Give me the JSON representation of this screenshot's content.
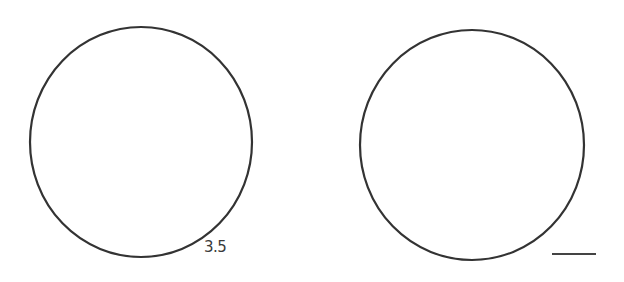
{
  "figure": {
    "left_panel": {
      "shape": "circle",
      "label": "3.5",
      "stroke_color": "#333333"
    },
    "right_panel": {
      "shape": "circle",
      "stroke_color": "#333333",
      "scale_bar": true
    },
    "background_color": "#ffffff"
  }
}
